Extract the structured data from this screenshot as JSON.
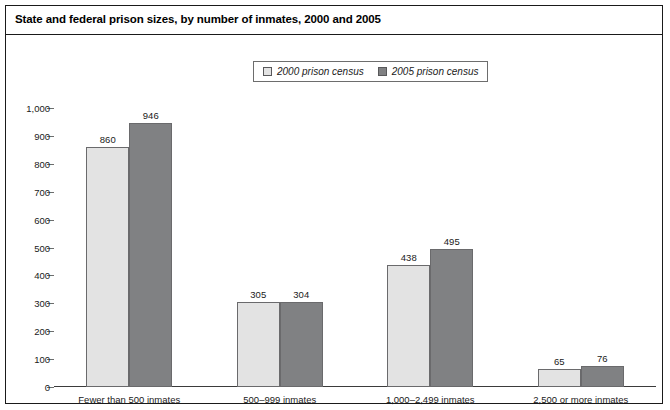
{
  "header": {
    "title": "State and federal prison sizes, by number of inmates, 2000 and 2005"
  },
  "legend": {
    "items": [
      {
        "label": "2000 prison census",
        "swatch": "light-gray-square-icon",
        "color": "#e3e3e3"
      },
      {
        "label": "2005 prison census",
        "swatch": "dark-gray-square-icon",
        "color": "#808183"
      }
    ]
  },
  "chart_data": {
    "type": "bar",
    "title": "State and federal prison sizes, by number of inmates, 2000 and 2005",
    "xlabel": "",
    "ylabel": "",
    "categories": [
      "Fewer than 500 inmates",
      "500–999 inmates",
      "1,000–2,499 inmates",
      "2,500 or more inmates"
    ],
    "series": [
      {
        "name": "2000 prison census",
        "color": "#e3e3e3",
        "values": [
          860,
          305,
          438,
          65
        ]
      },
      {
        "name": "2005 prison census",
        "color": "#808183",
        "values": [
          946,
          304,
          495,
          76
        ]
      }
    ],
    "ylim": [
      0,
      1000
    ],
    "ytick_values": [
      0,
      100,
      200,
      300,
      400,
      500,
      600,
      700,
      800,
      900,
      1000
    ],
    "ytick_labels": [
      "0",
      "100",
      "200",
      "300",
      "400",
      "500",
      "600",
      "700",
      "800",
      "900",
      "1,000"
    ],
    "grid": false,
    "legend_position": "top-center",
    "data_labels": true
  }
}
